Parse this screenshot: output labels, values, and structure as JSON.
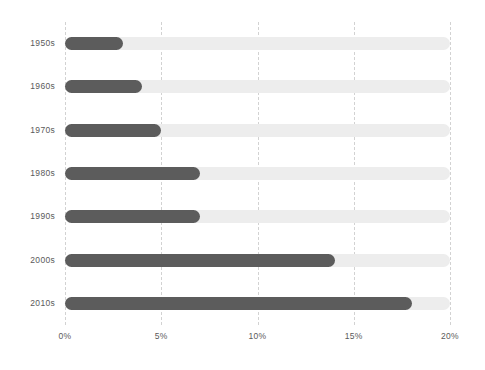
{
  "chart_data": {
    "type": "bar",
    "orientation": "horizontal",
    "title": "",
    "subtitle": "",
    "xlabel": "",
    "ylabel": "",
    "categories": [
      "1950s",
      "1960s",
      "1970s",
      "1980s",
      "1990s",
      "2000s",
      "2010s"
    ],
    "values": [
      3,
      4,
      5,
      7,
      7,
      14,
      18
    ],
    "series": [
      {
        "name": "share",
        "values": [
          3,
          4,
          5,
          7,
          7,
          14,
          18
        ]
      }
    ],
    "xlim": [
      0,
      20
    ],
    "xticks": [
      0,
      5,
      10,
      15,
      20
    ],
    "xtick_labels": [
      "0%",
      "5%",
      "10%",
      "15%",
      "20%"
    ],
    "grid": true,
    "grid_axis": "x",
    "grid_style": "dashed",
    "legend": false,
    "legend_position": "none",
    "track_max": 20,
    "annotations": []
  },
  "style": {
    "background": "#ffffff",
    "bar_color": "#5c5c5c",
    "track_color": "#ededed",
    "gridline_color": "#d2d2d2",
    "label_color": "#5a5a5a"
  }
}
